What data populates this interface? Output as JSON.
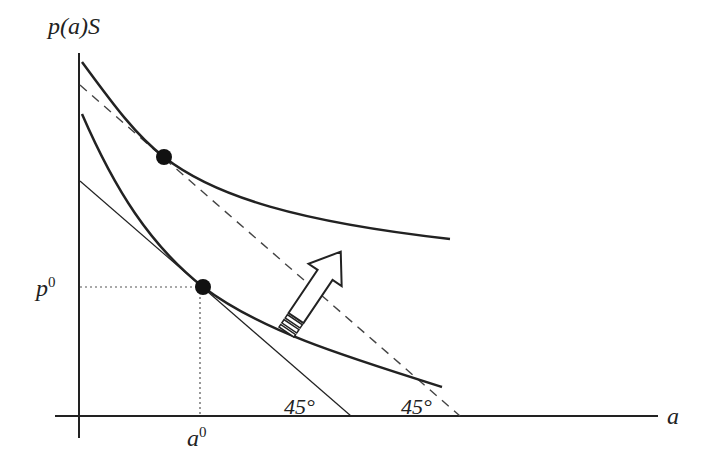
{
  "diagram": {
    "y_axis_label": "p(a)S",
    "x_axis_label": "a",
    "p0_label": "p",
    "p0_sup": "0",
    "a0_label": "a",
    "a0_sup": "0",
    "angle_label_1": "45°",
    "angle_label_2": "45°",
    "colors": {
      "ink": "#222222",
      "dotted": "#555555",
      "dashed": "#444444"
    },
    "elements": [
      "upper indifference curve with tangency point",
      "dashed 45-degree budget line",
      "lower indifference curve with tangency point at (a0, p0)",
      "thin 45-degree tangent line",
      "outline arrow indicating upward shift"
    ]
  }
}
